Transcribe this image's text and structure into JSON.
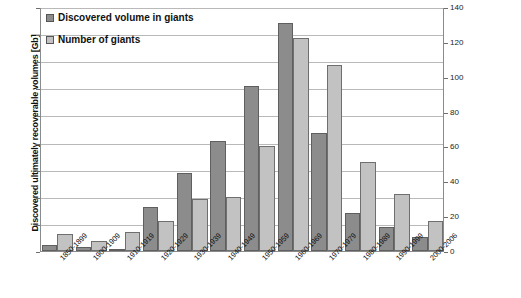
{
  "chart_data": {
    "type": "bar",
    "title": "",
    "xlabel": "",
    "ylabel": "Discovered ultimately recoverable volumes [Gb]",
    "y2label": "Number of fields",
    "ylim": [
      0,
      450
    ],
    "y2lim": [
      0,
      140
    ],
    "ytick_step": 50,
    "y2tick_step": 20,
    "yticks": [
      "0",
      "50",
      "100",
      "150",
      "200",
      "250",
      "300",
      "350",
      "400",
      "450"
    ],
    "y2ticks": [
      "0",
      "20",
      "40",
      "60",
      "80",
      "100",
      "120",
      "140"
    ],
    "grid": true,
    "legend_position": "top-left",
    "categories": [
      "1850-1899",
      "1900-1909",
      "1910-1919",
      "1920-1929",
      "1930-1939",
      "1940-1949",
      "1950-1959",
      "1960-1969",
      "1970-1979",
      "1980-1989",
      "1990-1999",
      "2000-2006"
    ],
    "series": [
      {
        "name": "Discovered volume in giants",
        "axis": "left",
        "unit": "Gb",
        "color": "#8c8c8c",
        "values": [
          12,
          7,
          3,
          82,
          143,
          203,
          305,
          420,
          218,
          70,
          45,
          25
        ]
      },
      {
        "name": "Number of giants",
        "axis": "right",
        "unit": "fields",
        "color": "#c2c2c2",
        "values": [
          10,
          6,
          11,
          17,
          30,
          31,
          60,
          122,
          107,
          51,
          33,
          17
        ]
      }
    ]
  },
  "legend": {
    "items": [
      {
        "label": "Discovered volume in giants",
        "swatch": "dark"
      },
      {
        "label": "Number of giants",
        "swatch": "light"
      }
    ]
  }
}
